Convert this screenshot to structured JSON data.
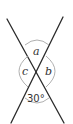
{
  "diagram": {
    "type": "intersecting-lines-angles",
    "angles": {
      "top": "a",
      "right": "b",
      "left": "c",
      "bottom": "30°"
    },
    "colors": {
      "lines": "#2b2b2b",
      "arcs": "#9a9a9a",
      "text": "#333333",
      "background": "#ffffff"
    }
  }
}
